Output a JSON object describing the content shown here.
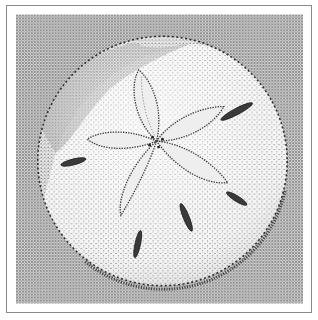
{
  "illustration": {
    "subject": "Sand dollar (stipple illustration)",
    "style": "black-and-white stippling",
    "colors": {
      "background": "#ffffff",
      "frame_border": "#8a8a8a",
      "field_tone": "#b8b8b8",
      "shell_light": "#f4f4f4",
      "ink": "#2a2a2a"
    },
    "petal_count": 5,
    "slit_count": 5
  }
}
